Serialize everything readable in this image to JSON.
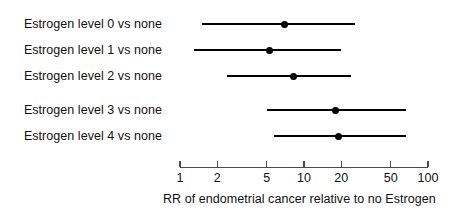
{
  "chart_data": {
    "type": "scatter",
    "subtype": "forest-plot",
    "title": "",
    "xlabel": "RR of endometrial cancer relative to no Estrogen",
    "ylabel": "",
    "xscale": "log",
    "xlim": [
      1,
      100
    ],
    "xticks": [
      1,
      2,
      5,
      10,
      20,
      50,
      100
    ],
    "xticklabels": [
      "1",
      "2",
      "5",
      "10",
      "20",
      "50",
      "100"
    ],
    "grid": false,
    "legend": null,
    "categories": [
      "Estrogen level 0 vs none",
      "Estrogen level 1 vs none",
      "Estrogen level 2 vs none",
      "Estrogen level 3 vs none",
      "Estrogen level 4 vs none"
    ],
    "values": [
      7.0,
      5.3,
      8.2,
      18.0,
      19.0
    ],
    "ci_lower": [
      1.5,
      1.3,
      2.4,
      5.0,
      5.7
    ],
    "ci_upper": [
      26.0,
      20.0,
      24.0,
      66.0,
      67.0
    ],
    "rows": [
      {
        "label": "Estrogen level 0 vs none",
        "estimate": 7.0,
        "lower": 1.5,
        "upper": 26.0
      },
      {
        "label": "Estrogen level 1 vs none",
        "estimate": 5.3,
        "lower": 1.3,
        "upper": 20.0
      },
      {
        "label": "Estrogen level 2 vs none",
        "estimate": 8.2,
        "lower": 2.4,
        "upper": 24.0
      },
      {
        "label": "Estrogen level 3 vs none",
        "estimate": 18.0,
        "lower": 5.0,
        "upper": 66.0
      },
      {
        "label": "Estrogen level 4 vs none",
        "estimate": 19.0,
        "lower": 5.7,
        "upper": 67.0
      }
    ],
    "colors": {
      "point": "#000000",
      "line": "#000000",
      "axis": "#4a4a4a",
      "text": "#111111",
      "background": "#ffffff"
    }
  },
  "layout": {
    "axis_x_start_px": 180,
    "axis_x_end_px": 428,
    "px_per_decade": 124,
    "row_y_px": [
      24,
      50,
      76,
      110,
      136
    ],
    "axis_y_px": 167,
    "tick_label_y_px": 172,
    "axis_title_y_px": 193,
    "axis_title_x_px": 163,
    "label_right_edge_px": 162
  }
}
